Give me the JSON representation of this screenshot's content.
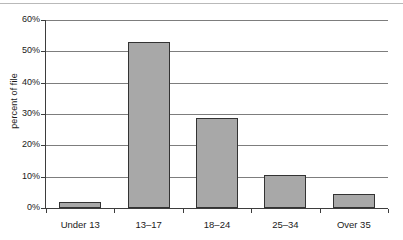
{
  "chart_data": {
    "type": "bar",
    "title": "",
    "xlabel": "",
    "ylabel": "percent of file",
    "categories": [
      "Under 13",
      "13–17",
      "18–24",
      "25–34",
      "Over 35"
    ],
    "values": [
      2,
      53,
      28.6,
      10.5,
      4.5
    ],
    "ylim": [
      0,
      60
    ],
    "ytick_labels": [
      "60%",
      "50%",
      "40%",
      "30%",
      "20%",
      "10%",
      "0%"
    ],
    "ytick_values": [
      60,
      50,
      40,
      30,
      20,
      10,
      0
    ],
    "grid": true,
    "legend": false,
    "bar_fill": "#a8a8a8",
    "bar_edge": "#333333",
    "gridline_color": "#7d7d7d",
    "axis_color": "#3d3d3d",
    "background": "#ffffff"
  }
}
